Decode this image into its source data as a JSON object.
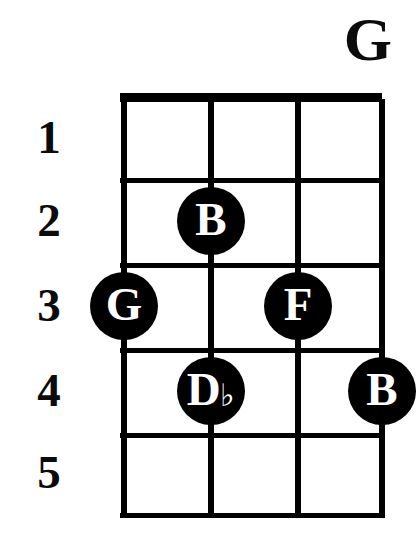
{
  "chord": {
    "name": "G",
    "instrument_strings": 4,
    "fret_count": 5
  },
  "fret_numbers": [
    {
      "label": "1"
    },
    {
      "label": "2"
    },
    {
      "label": "3"
    },
    {
      "label": "4"
    },
    {
      "label": "5"
    }
  ],
  "dots": [
    {
      "note": "B",
      "accidental": "",
      "string": 2,
      "fret": 2
    },
    {
      "note": "G",
      "accidental": "",
      "string": 1,
      "fret": 3
    },
    {
      "note": "F",
      "accidental": "",
      "string": 3,
      "fret": 3
    },
    {
      "note": "D",
      "accidental": "♭",
      "string": 2,
      "fret": 4
    },
    {
      "note": "B",
      "accidental": "",
      "string": 4,
      "fret": 4
    }
  ],
  "colors": {
    "ink": "#000000",
    "paper": "#ffffff",
    "dot_label": "#ffffff"
  },
  "geometry": {
    "string_x": [
      4,
      91,
      178,
      262
    ],
    "fret_y": [
      7,
      88,
      173,
      258,
      343,
      423
    ],
    "fret_space_center_y": [
      48,
      131,
      216,
      301,
      383
    ]
  },
  "chart_data": {
    "type": "table",
    "title": "G",
    "xlabel": "strings",
    "ylabel": "frets",
    "categories": [
      "string 1",
      "string 2",
      "string 3",
      "string 4"
    ],
    "tick_labels": [
      "1",
      "2",
      "3",
      "4",
      "5"
    ],
    "values": [
      3,
      2,
      3,
      4
    ],
    "annotations": [
      "G",
      "B",
      "F",
      "D♭",
      "B"
    ],
    "grid": true,
    "legend": "none"
  }
}
